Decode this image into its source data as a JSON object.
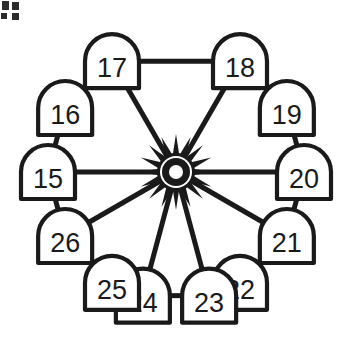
{
  "figure": {
    "title": "",
    "corner_label": "c.",
    "hub": {
      "name": "center-hub",
      "icon": "starburst-hub-icon",
      "spoke_count": 8
    },
    "colors": {
      "stroke": "#1a1a1a",
      "fill": "#ffffff",
      "background": "#ffffff"
    },
    "nodes": [
      {
        "id": "node-15",
        "label": "15",
        "angle_deg": 180,
        "has_spoke": true
      },
      {
        "id": "node-16",
        "label": "16",
        "angle_deg": 210,
        "has_spoke": false
      },
      {
        "id": "node-17",
        "label": "17",
        "angle_deg": 240,
        "has_spoke": true
      },
      {
        "id": "node-18",
        "label": "18",
        "angle_deg": 300,
        "has_spoke": true
      },
      {
        "id": "node-19",
        "label": "19",
        "angle_deg": 330,
        "has_spoke": false
      },
      {
        "id": "node-20",
        "label": "20",
        "angle_deg": 0,
        "has_spoke": true
      },
      {
        "id": "node-21",
        "label": "21",
        "angle_deg": 30,
        "has_spoke": true
      },
      {
        "id": "node-22",
        "label": "22",
        "angle_deg": 60,
        "has_spoke": false
      },
      {
        "id": "node-23",
        "label": "23",
        "angle_deg": 75,
        "has_spoke": true
      },
      {
        "id": "node-24",
        "label": "24",
        "angle_deg": 105,
        "has_spoke": true
      },
      {
        "id": "node-25",
        "label": "25",
        "angle_deg": 120,
        "has_spoke": false
      },
      {
        "id": "node-26",
        "label": "26",
        "angle_deg": 150,
        "has_spoke": true
      }
    ],
    "ring_edges": [
      [
        "node-15",
        "node-16"
      ],
      [
        "node-16",
        "node-17"
      ],
      [
        "node-17",
        "node-18"
      ],
      [
        "node-18",
        "node-19"
      ],
      [
        "node-19",
        "node-20"
      ],
      [
        "node-20",
        "node-21"
      ],
      [
        "node-21",
        "node-22"
      ],
      [
        "node-22",
        "node-23"
      ],
      [
        "node-23",
        "node-24"
      ],
      [
        "node-24",
        "node-25"
      ],
      [
        "node-25",
        "node-26"
      ],
      [
        "node-26",
        "node-15"
      ]
    ],
    "spoke_nodes": [
      "node-15",
      "node-17",
      "node-18",
      "node-20",
      "node-21",
      "node-23",
      "node-24",
      "node-26"
    ]
  }
}
